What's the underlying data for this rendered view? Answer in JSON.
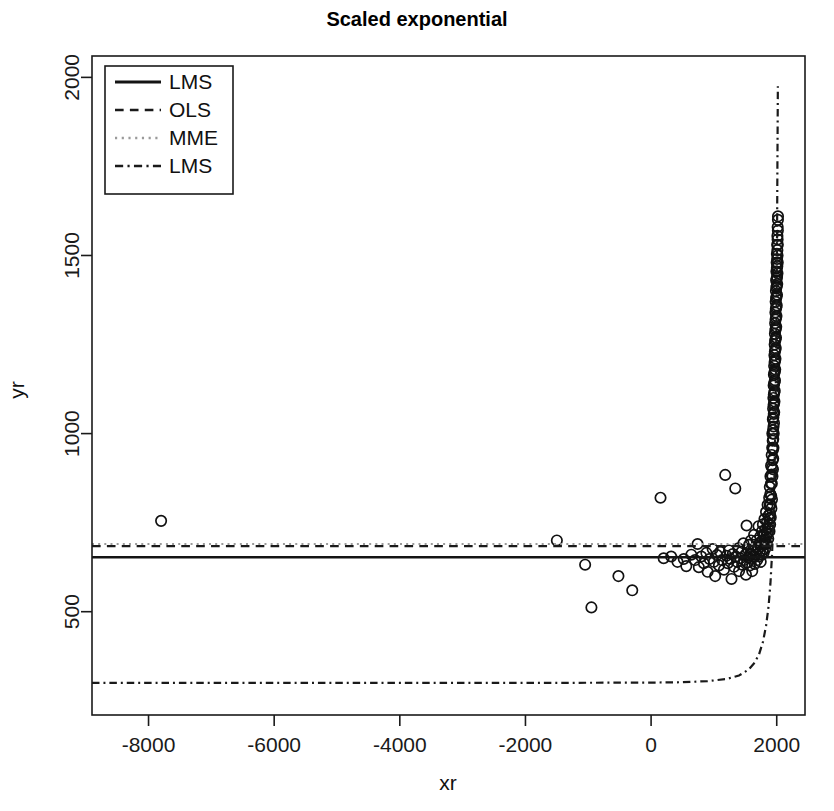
{
  "chart_data": {
    "type": "scatter",
    "title": "Scaled exponential",
    "xlabel": "xr",
    "ylabel": "yr",
    "xlim": [
      -8900,
      2450
    ],
    "ylim": [
      210,
      2060
    ],
    "xticks": [
      -8000,
      -6000,
      -4000,
      -2000,
      0,
      2000
    ],
    "xticklabels": [
      "-8000",
      "-6000",
      "-4000",
      "-2000",
      "0",
      "2000"
    ],
    "yticks": [
      500,
      1000,
      1500,
      2000
    ],
    "yticklabels": [
      "500",
      "1000",
      "1500",
      "2000"
    ],
    "grid": false,
    "legend_position": "top-left",
    "point_marker": "open-circle",
    "points": [
      [
        -7800,
        755
      ],
      [
        -1500,
        700
      ],
      [
        -1050,
        632
      ],
      [
        -950,
        512
      ],
      [
        -520,
        600
      ],
      [
        -300,
        560
      ],
      [
        150,
        820
      ],
      [
        200,
        650
      ],
      [
        320,
        655
      ],
      [
        420,
        640
      ],
      [
        520,
        648
      ],
      [
        560,
        628
      ],
      [
        640,
        660
      ],
      [
        700,
        645
      ],
      [
        740,
        690
      ],
      [
        760,
        625
      ],
      [
        800,
        655
      ],
      [
        840,
        636
      ],
      [
        880,
        665
      ],
      [
        900,
        612
      ],
      [
        930,
        648
      ],
      [
        980,
        676
      ],
      [
        1000,
        640
      ],
      [
        1020,
        600
      ],
      [
        1050,
        659
      ],
      [
        1080,
        630
      ],
      [
        1100,
        668
      ],
      [
        1130,
        645
      ],
      [
        1160,
        618
      ],
      [
        1180,
        884
      ],
      [
        1200,
        657
      ],
      [
        1220,
        636
      ],
      [
        1240,
        672
      ],
      [
        1260,
        648
      ],
      [
        1280,
        592
      ],
      [
        1300,
        662
      ],
      [
        1320,
        626
      ],
      [
        1340,
        846
      ],
      [
        1350,
        655
      ],
      [
        1370,
        640
      ],
      [
        1390,
        678
      ],
      [
        1400,
        614
      ],
      [
        1420,
        650
      ],
      [
        1440,
        668
      ],
      [
        1450,
        632
      ],
      [
        1470,
        692
      ],
      [
        1480,
        645
      ],
      [
        1500,
        660
      ],
      [
        1510,
        604
      ],
      [
        1520,
        742
      ],
      [
        1530,
        638
      ],
      [
        1540,
        676
      ],
      [
        1550,
        652
      ],
      [
        1560,
        688
      ],
      [
        1570,
        630
      ],
      [
        1580,
        664
      ],
      [
        1590,
        700
      ],
      [
        1600,
        648
      ],
      [
        1610,
        614
      ],
      [
        1620,
        672
      ],
      [
        1630,
        656
      ],
      [
        1640,
        716
      ],
      [
        1650,
        634
      ],
      [
        1660,
        680
      ],
      [
        1670,
        660
      ],
      [
        1680,
        700
      ],
      [
        1690,
        645
      ],
      [
        1700,
        676
      ],
      [
        1710,
        740
      ],
      [
        1715,
        655
      ],
      [
        1720,
        690
      ],
      [
        1730,
        668
      ],
      [
        1740,
        712
      ],
      [
        1745,
        640
      ],
      [
        1750,
        684
      ],
      [
        1760,
        660
      ],
      [
        1765,
        726
      ],
      [
        1770,
        700
      ],
      [
        1775,
        672
      ],
      [
        1780,
        745
      ],
      [
        1785,
        690
      ],
      [
        1790,
        665
      ],
      [
        1795,
        714
      ],
      [
        1800,
        688
      ],
      [
        1805,
        760
      ],
      [
        1810,
        700
      ],
      [
        1815,
        676
      ],
      [
        1820,
        730
      ],
      [
        1825,
        695
      ],
      [
        1830,
        780
      ],
      [
        1835,
        712
      ],
      [
        1840,
        690
      ],
      [
        1845,
        752
      ],
      [
        1850,
        720
      ],
      [
        1855,
        800
      ],
      [
        1860,
        735
      ],
      [
        1865,
        705
      ],
      [
        1870,
        770
      ],
      [
        1875,
        745
      ],
      [
        1880,
        820
      ],
      [
        1882,
        760
      ],
      [
        1885,
        726
      ],
      [
        1888,
        800
      ],
      [
        1890,
        850
      ],
      [
        1892,
        775
      ],
      [
        1895,
        745
      ],
      [
        1898,
        830
      ],
      [
        1900,
        880
      ],
      [
        1902,
        800
      ],
      [
        1905,
        765
      ],
      [
        1908,
        860
      ],
      [
        1910,
        910
      ],
      [
        1912,
        825
      ],
      [
        1915,
        790
      ],
      [
        1918,
        885
      ],
      [
        1920,
        940
      ],
      [
        1922,
        860
      ],
      [
        1924,
        815
      ],
      [
        1926,
        905
      ],
      [
        1928,
        960
      ],
      [
        1930,
        1000
      ],
      [
        1932,
        880
      ],
      [
        1934,
        925
      ],
      [
        1936,
        980
      ],
      [
        1938,
        1040
      ],
      [
        1940,
        900
      ],
      [
        1941,
        955
      ],
      [
        1942,
        1010
      ],
      [
        1943,
        1070
      ],
      [
        1944,
        930
      ],
      [
        1945,
        985
      ],
      [
        1946,
        1045
      ],
      [
        1947,
        1100
      ],
      [
        1948,
        960
      ],
      [
        1949,
        1020
      ],
      [
        1950,
        1080
      ],
      [
        1951,
        1135
      ],
      [
        1952,
        1000
      ],
      [
        1953,
        1055
      ],
      [
        1954,
        1110
      ],
      [
        1955,
        1165
      ],
      [
        1956,
        1030
      ],
      [
        1957,
        1085
      ],
      [
        1958,
        1140
      ],
      [
        1959,
        1190
      ],
      [
        1960,
        1060
      ],
      [
        1961,
        1115
      ],
      [
        1962,
        1170
      ],
      [
        1963,
        1220
      ],
      [
        1964,
        1090
      ],
      [
        1965,
        1145
      ],
      [
        1966,
        1200
      ],
      [
        1967,
        1250
      ],
      [
        1968,
        1120
      ],
      [
        1969,
        1175
      ],
      [
        1970,
        1230
      ],
      [
        1971,
        1280
      ],
      [
        1972,
        1150
      ],
      [
        1973,
        1205
      ],
      [
        1974,
        1260
      ],
      [
        1975,
        1310
      ],
      [
        1976,
        1180
      ],
      [
        1977,
        1235
      ],
      [
        1978,
        1290
      ],
      [
        1979,
        1340
      ],
      [
        1980,
        1210
      ],
      [
        1981,
        1265
      ],
      [
        1982,
        1320
      ],
      [
        1983,
        1370
      ],
      [
        1984,
        1240
      ],
      [
        1985,
        1295
      ],
      [
        1986,
        1350
      ],
      [
        1987,
        1400
      ],
      [
        1988,
        1270
      ],
      [
        1989,
        1325
      ],
      [
        1990,
        1380
      ],
      [
        1991,
        1430
      ],
      [
        1992,
        1300
      ],
      [
        1993,
        1355
      ],
      [
        1994,
        1410
      ],
      [
        1995,
        1455
      ],
      [
        1996,
        1330
      ],
      [
        1997,
        1385
      ],
      [
        1998,
        1435
      ],
      [
        1999,
        1480
      ],
      [
        2000,
        1360
      ],
      [
        2001,
        1415
      ],
      [
        2002,
        1465
      ],
      [
        2003,
        1505
      ],
      [
        2004,
        1390
      ],
      [
        2005,
        1440
      ],
      [
        2006,
        1490
      ],
      [
        2007,
        1530
      ],
      [
        2008,
        1420
      ],
      [
        2009,
        1470
      ],
      [
        2010,
        1515
      ],
      [
        2011,
        1555
      ],
      [
        2012,
        1450
      ],
      [
        2013,
        1500
      ],
      [
        2014,
        1545
      ],
      [
        2015,
        1580
      ],
      [
        2016,
        1480
      ],
      [
        2017,
        1530
      ],
      [
        2018,
        1570
      ],
      [
        2019,
        1600
      ],
      [
        2020,
        1610
      ]
    ],
    "series": [
      {
        "name": "LMS",
        "style": "solid",
        "color": "#141414",
        "width": 2.6,
        "kind": "horizontal",
        "level": 653,
        "points": [
          [
            -8900,
            653
          ],
          [
            2450,
            653
          ]
        ]
      },
      {
        "name": "OLS",
        "style": "dashed",
        "color": "#1a1a1a",
        "width": 2.4,
        "kind": "horizontal",
        "level": 684,
        "points": [
          [
            -8900,
            684
          ],
          [
            2450,
            684
          ]
        ]
      },
      {
        "name": "MME",
        "style": "dotted",
        "color": "#9a9a9a",
        "width": 2.2,
        "kind": "horizontal",
        "level": 690,
        "points": [
          [
            -8900,
            690
          ],
          [
            2450,
            690
          ]
        ]
      },
      {
        "name": "LMS",
        "style": "dashdot",
        "color": "#1a1a1a",
        "width": 2.2,
        "kind": "exponential",
        "baseline": 300,
        "points": [
          [
            -8900,
            300
          ],
          [
            -6000,
            300
          ],
          [
            -4000,
            300
          ],
          [
            -2000,
            300
          ],
          [
            0,
            301
          ],
          [
            500,
            302
          ],
          [
            900,
            305
          ],
          [
            1200,
            311
          ],
          [
            1400,
            321
          ],
          [
            1550,
            337
          ],
          [
            1650,
            357
          ],
          [
            1720,
            381
          ],
          [
            1780,
            415
          ],
          [
            1830,
            460
          ],
          [
            1870,
            515
          ],
          [
            1900,
            580
          ],
          [
            1925,
            660
          ],
          [
            1945,
            750
          ],
          [
            1960,
            850
          ],
          [
            1972,
            960
          ],
          [
            1982,
            1080
          ],
          [
            1990,
            1210
          ],
          [
            1997,
            1350
          ],
          [
            2002,
            1480
          ],
          [
            2007,
            1620
          ],
          [
            2011,
            1760
          ],
          [
            2015,
            1880
          ],
          [
            2018,
            1975
          ]
        ]
      }
    ],
    "legend": {
      "entries": [
        {
          "label": "LMS",
          "style": "solid",
          "color": "#141414"
        },
        {
          "label": "OLS",
          "style": "dashed",
          "color": "#1a1a1a"
        },
        {
          "label": "MME",
          "style": "dotted",
          "color": "#9a9a9a"
        },
        {
          "label": "LMS",
          "style": "dashdot",
          "color": "#1a1a1a"
        }
      ]
    }
  }
}
